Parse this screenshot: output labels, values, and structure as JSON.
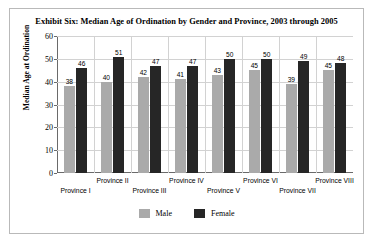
{
  "chart_data": {
    "type": "bar",
    "title": "Exhibit Six: Median Age of Ordination by Gender and Province, 2003 through 2005",
    "xlabel": "",
    "ylabel": "Median Age at Ordination",
    "ylim": [
      0,
      60
    ],
    "ytick_step": 10,
    "yticks": [
      0,
      10,
      20,
      30,
      40,
      50,
      60
    ],
    "ytick_labels": [
      "0",
      "10",
      "20",
      "30",
      "40",
      "50",
      "60"
    ],
    "grid": true,
    "legend_position": "bottom",
    "categories": [
      "Province I",
      "Province II",
      "Province III",
      "Province IV",
      "Province V",
      "Province VI",
      "Province VII",
      "Province VIII"
    ],
    "series": [
      {
        "name": "Male",
        "color": "#aaaaaa",
        "values": [
          38,
          40,
          42,
          41,
          43,
          45,
          39,
          45
        ],
        "value_labels": [
          "38",
          "40",
          "42",
          "41",
          "43",
          "45",
          "39",
          "45"
        ]
      },
      {
        "name": "Female",
        "color": "#262626",
        "values": [
          46,
          51,
          47,
          47,
          50,
          50,
          49,
          48
        ],
        "value_labels": [
          "46",
          "51",
          "47",
          "47",
          "50",
          "50",
          "49",
          "48"
        ]
      }
    ]
  },
  "legend": {
    "items": [
      {
        "label": "Male",
        "color": "#aaaaaa"
      },
      {
        "label": "Female",
        "color": "#262626"
      }
    ]
  },
  "colors": {
    "male": "#aaaaaa",
    "female": "#262626",
    "grid": "#d2d2d2",
    "axis": "#6a6a6a",
    "frame": "#b9b9b9",
    "background": "#ffffff",
    "text": "#000000"
  }
}
